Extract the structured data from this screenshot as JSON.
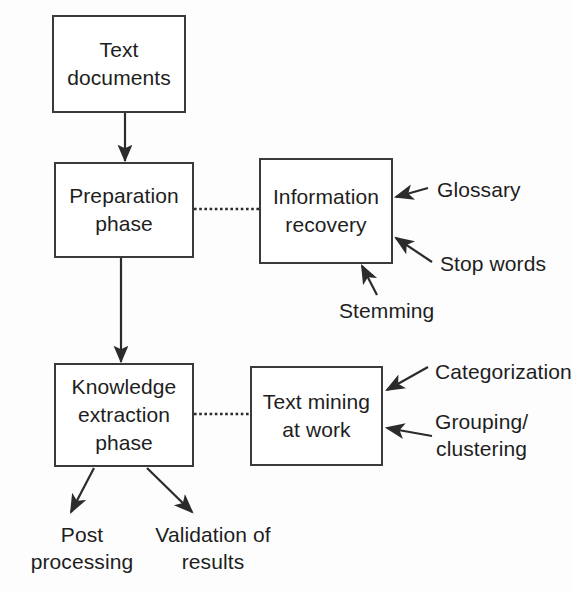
{
  "diagram": {
    "background_color": "#fdfdfd",
    "stroke_color": "#3a3a3a",
    "text_color": "#1e1e1e",
    "nodes": [
      {
        "id": "text-documents",
        "label": "Text\ndocuments"
      },
      {
        "id": "preparation-phase",
        "label": "Preparation\nphase"
      },
      {
        "id": "information-recovery",
        "label": "Information\nrecovery"
      },
      {
        "id": "knowledge-extraction",
        "label": "Knowledge\nextraction\nphase"
      },
      {
        "id": "text-mining-at-work",
        "label": "Text mining\nat work"
      }
    ],
    "annotations": [
      {
        "id": "glossary",
        "label": "Glossary"
      },
      {
        "id": "stop-words",
        "label": "Stop words"
      },
      {
        "id": "stemming",
        "label": "Stemming"
      },
      {
        "id": "categorization",
        "label": "Categorization"
      },
      {
        "id": "grouping-clustering",
        "label": "Grouping/\nclustering"
      },
      {
        "id": "post-processing",
        "label": "Post\nprocessing"
      },
      {
        "id": "validation-of-results",
        "label": "Validation of\nresults"
      }
    ],
    "connectors": [
      {
        "id": "documents-to-preparation",
        "style": "solid-arrow"
      },
      {
        "id": "preparation-to-knowledge",
        "style": "solid-arrow"
      },
      {
        "id": "preparation-to-information",
        "style": "dotted-line"
      },
      {
        "id": "knowledge-to-textmining",
        "style": "dotted-line"
      },
      {
        "id": "glossary-arrow",
        "style": "solid-arrow"
      },
      {
        "id": "stop-words-arrow",
        "style": "solid-arrow"
      },
      {
        "id": "stemming-arrow",
        "style": "solid-arrow"
      },
      {
        "id": "categorization-arrow",
        "style": "solid-arrow"
      },
      {
        "id": "grouping-clustering-arrow",
        "style": "solid-arrow"
      },
      {
        "id": "post-processing-arrow",
        "style": "solid-arrow"
      },
      {
        "id": "validation-arrow",
        "style": "solid-arrow"
      }
    ]
  }
}
